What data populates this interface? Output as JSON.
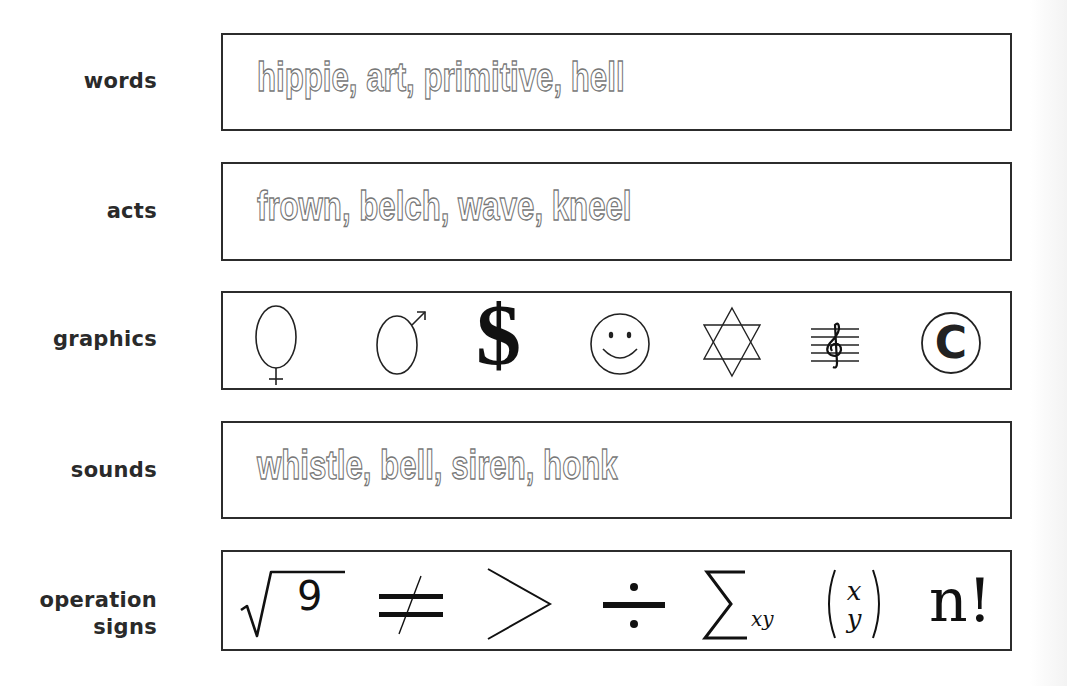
{
  "rows": [
    {
      "label": "words",
      "content": "hippie, art, primitive, hell"
    },
    {
      "label": "acts",
      "content": "frown, belch, wave, kneel"
    },
    {
      "label": "graphics",
      "icons": [
        "female-symbol",
        "male-symbol",
        "dollar-sign",
        "smiley-face",
        "star-of-david",
        "treble-clef-staff",
        "copyright-symbol"
      ]
    },
    {
      "label": "sounds",
      "content": "whistle, bell, siren, honk"
    },
    {
      "label_line1": "operation",
      "label_line2": "signs",
      "icons": [
        "square-root-of-9",
        "not-equal",
        "greater-than",
        "division",
        "summation-xy",
        "binomial-x-y",
        "n-factorial"
      ]
    }
  ],
  "symbols": {
    "dollar": "$",
    "copyright": "C",
    "sqrt_arg": "9",
    "sum_sub": "xy",
    "binom_top": "x",
    "binom_bottom": "y",
    "factorial": "n!"
  }
}
